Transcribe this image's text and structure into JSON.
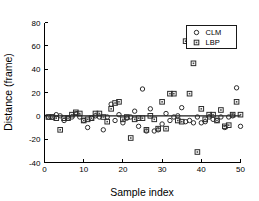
{
  "chart_data": {
    "type": "scatter",
    "title": "",
    "xlabel": "Sample index",
    "ylabel": "Distance (frame)",
    "xlim": [
      0,
      50
    ],
    "ylim": [
      -40,
      80
    ],
    "xticks": [
      0,
      10,
      20,
      30,
      40,
      50
    ],
    "yticks": [
      -40,
      -20,
      0,
      20,
      40,
      60,
      80
    ],
    "xticklabels": [
      "0",
      "10",
      "20",
      "30",
      "40",
      "50"
    ],
    "yticklabels": [
      "-40",
      "-20",
      "0",
      "20",
      "40",
      "60",
      "80"
    ],
    "grid": false,
    "legend_position": "upper right",
    "reference_line": {
      "y": 0,
      "visible": true
    },
    "series": [
      {
        "name": "CLM",
        "marker": "circle",
        "color": "#2b2b2b",
        "points": [
          [
            1,
            -1
          ],
          [
            2,
            -1
          ],
          [
            3,
            1
          ],
          [
            4,
            0
          ],
          [
            5,
            -4
          ],
          [
            6,
            -2
          ],
          [
            7,
            -1
          ],
          [
            8,
            2
          ],
          [
            9,
            -1
          ],
          [
            10,
            -4
          ],
          [
            11,
            -10
          ],
          [
            12,
            -2
          ],
          [
            13,
            0
          ],
          [
            14,
            -1
          ],
          [
            15,
            -12
          ],
          [
            16,
            -1
          ],
          [
            17,
            10
          ],
          [
            18,
            -4
          ],
          [
            19,
            1
          ],
          [
            20,
            -6
          ],
          [
            21,
            -2
          ],
          [
            22,
            -1
          ],
          [
            23,
            4
          ],
          [
            24,
            -9
          ],
          [
            25,
            23
          ],
          [
            26,
            -13
          ],
          [
            27,
            6
          ],
          [
            28,
            -13
          ],
          [
            29,
            -12
          ],
          [
            30,
            -7
          ],
          [
            31,
            2
          ],
          [
            32,
            -4
          ],
          [
            33,
            -1
          ],
          [
            34,
            0
          ],
          [
            35,
            7
          ],
          [
            36,
            -5
          ],
          [
            37,
            -4
          ],
          [
            38,
            -6
          ],
          [
            39,
            -1
          ],
          [
            40,
            -6
          ],
          [
            41,
            -5
          ],
          [
            42,
            -1
          ],
          [
            43,
            -3
          ],
          [
            44,
            -4
          ],
          [
            45,
            -1
          ],
          [
            46,
            -10
          ],
          [
            47,
            -1
          ],
          [
            48,
            0
          ],
          [
            49,
            24
          ],
          [
            50,
            -9
          ]
        ]
      },
      {
        "name": "LBP",
        "marker": "square",
        "color": "#2b2b2b",
        "points": [
          [
            1,
            -1
          ],
          [
            2,
            -1
          ],
          [
            3,
            -2
          ],
          [
            4,
            -12
          ],
          [
            5,
            -2
          ],
          [
            6,
            -2
          ],
          [
            7,
            1
          ],
          [
            8,
            3
          ],
          [
            9,
            2
          ],
          [
            10,
            -4
          ],
          [
            11,
            -3
          ],
          [
            12,
            -2
          ],
          [
            13,
            2
          ],
          [
            14,
            2
          ],
          [
            15,
            -1
          ],
          [
            16,
            -5
          ],
          [
            17,
            6
          ],
          [
            18,
            11
          ],
          [
            19,
            12
          ],
          [
            20,
            -3
          ],
          [
            21,
            -1
          ],
          [
            22,
            -19
          ],
          [
            23,
            -3
          ],
          [
            24,
            -2
          ],
          [
            25,
            -2
          ],
          [
            26,
            -12
          ],
          [
            27,
            0
          ],
          [
            28,
            -3
          ],
          [
            29,
            -11
          ],
          [
            30,
            12
          ],
          [
            31,
            -11
          ],
          [
            32,
            19
          ],
          [
            33,
            19
          ],
          [
            34,
            -4
          ],
          [
            35,
            -5
          ],
          [
            36,
            64
          ],
          [
            37,
            19
          ],
          [
            38,
            45
          ],
          [
            39,
            -31
          ],
          [
            40,
            6
          ],
          [
            41,
            -3
          ],
          [
            42,
            1
          ],
          [
            43,
            1
          ],
          [
            44,
            -4
          ],
          [
            45,
            5
          ],
          [
            46,
            -9
          ],
          [
            47,
            -8
          ],
          [
            48,
            1
          ],
          [
            49,
            12
          ],
          [
            50,
            1
          ]
        ]
      }
    ]
  },
  "legend": {
    "entries": [
      {
        "label": "CLM",
        "marker": "circle"
      },
      {
        "label": "LBP",
        "marker": "square"
      }
    ]
  }
}
